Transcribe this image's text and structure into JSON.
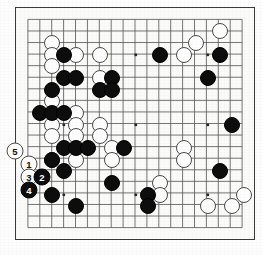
{
  "board": {
    "title": "Go board diagram",
    "size": 19,
    "geometry": {
      "left": 15,
      "top": 7,
      "width": 240,
      "height": 233,
      "cols": 19,
      "rows": 19,
      "col_spacing": 13.33,
      "row_spacing": 12.94
    },
    "colors": {
      "black_stone": "#0d0d0d",
      "white_stone": "#fefefe",
      "white_stone_border": "#4a4a4a",
      "grid_line": "#5a5a5a",
      "board_border": "#3a3a3a",
      "board_background": "#fbfbfa",
      "page_background": "#ffffff"
    },
    "star_points": [
      {
        "col": 3,
        "row": 3
      },
      {
        "col": 9,
        "row": 3
      },
      {
        "col": 15,
        "row": 3
      },
      {
        "col": 3,
        "row": 9
      },
      {
        "col": 9,
        "row": 9
      },
      {
        "col": 15,
        "row": 9
      },
      {
        "col": 3,
        "row": 15
      },
      {
        "col": 9,
        "row": 15
      },
      {
        "col": 15,
        "row": 15
      }
    ],
    "black_stones": [
      {
        "col": 3,
        "row": 3
      },
      {
        "col": 11,
        "row": 3
      },
      {
        "col": 16,
        "row": 3
      },
      {
        "col": 3,
        "row": 5
      },
      {
        "col": 4,
        "row": 5
      },
      {
        "col": 7,
        "row": 5
      },
      {
        "col": 15,
        "row": 5
      },
      {
        "col": 2,
        "row": 6
      },
      {
        "col": 6,
        "row": 6
      },
      {
        "col": 7,
        "row": 6
      },
      {
        "col": 1,
        "row": 8
      },
      {
        "col": 2,
        "row": 8
      },
      {
        "col": 3,
        "row": 8
      },
      {
        "col": 17,
        "row": 9
      },
      {
        "col": 3,
        "row": 11
      },
      {
        "col": 4,
        "row": 11
      },
      {
        "col": 5,
        "row": 11
      },
      {
        "col": 8,
        "row": 11
      },
      {
        "col": 2,
        "row": 12
      },
      {
        "col": 3,
        "row": 13
      },
      {
        "col": 16,
        "row": 13
      },
      {
        "col": 7,
        "row": 14
      },
      {
        "col": 10,
        "row": 15
      },
      {
        "col": 2,
        "row": 15
      },
      {
        "col": 10,
        "row": 16
      },
      {
        "col": 4,
        "row": 16
      }
    ],
    "white_stones": [
      {
        "col": 16,
        "row": 1
      },
      {
        "col": 2,
        "row": 2
      },
      {
        "col": 14,
        "row": 2
      },
      {
        "col": 2,
        "row": 3
      },
      {
        "col": 4,
        "row": 3
      },
      {
        "col": 6,
        "row": 3
      },
      {
        "col": 13,
        "row": 3
      },
      {
        "col": 2,
        "row": 4
      },
      {
        "col": 6,
        "row": 5
      },
      {
        "col": 2,
        "row": 7
      },
      {
        "col": 4,
        "row": 8
      },
      {
        "col": 2,
        "row": 9
      },
      {
        "col": 4,
        "row": 9
      },
      {
        "col": 6,
        "row": 9
      },
      {
        "col": 2,
        "row": 10
      },
      {
        "col": 4,
        "row": 10
      },
      {
        "col": 6,
        "row": 10
      },
      {
        "col": 7,
        "row": 11
      },
      {
        "col": 13,
        "row": 11
      },
      {
        "col": 2,
        "row": 12
      },
      {
        "col": 4,
        "row": 12
      },
      {
        "col": 7,
        "row": 12
      },
      {
        "col": 13,
        "row": 12
      },
      {
        "col": 11,
        "row": 14
      },
      {
        "col": 11,
        "row": 15
      },
      {
        "col": 18,
        "row": 15
      },
      {
        "col": 15,
        "row": 16
      },
      {
        "col": 17,
        "row": 16
      }
    ],
    "move_markers": [
      {
        "label": "5",
        "color": "white",
        "col": 0,
        "row": 11,
        "outside": true,
        "x": 15,
        "y": 151
      },
      {
        "label": "1",
        "color": "white",
        "col": 1,
        "row": 12,
        "outside": false,
        "x": 29,
        "y": 164
      },
      {
        "label": "3",
        "color": "white",
        "col": 1,
        "row": 13,
        "outside": false,
        "x": 29,
        "y": 177
      },
      {
        "label": "2",
        "color": "black",
        "col": 2,
        "row": 13,
        "outside": false,
        "x": 42,
        "y": 177
      },
      {
        "label": "4",
        "color": "black",
        "col": 1,
        "row": 14,
        "outside": false,
        "x": 29,
        "y": 190
      }
    ]
  }
}
